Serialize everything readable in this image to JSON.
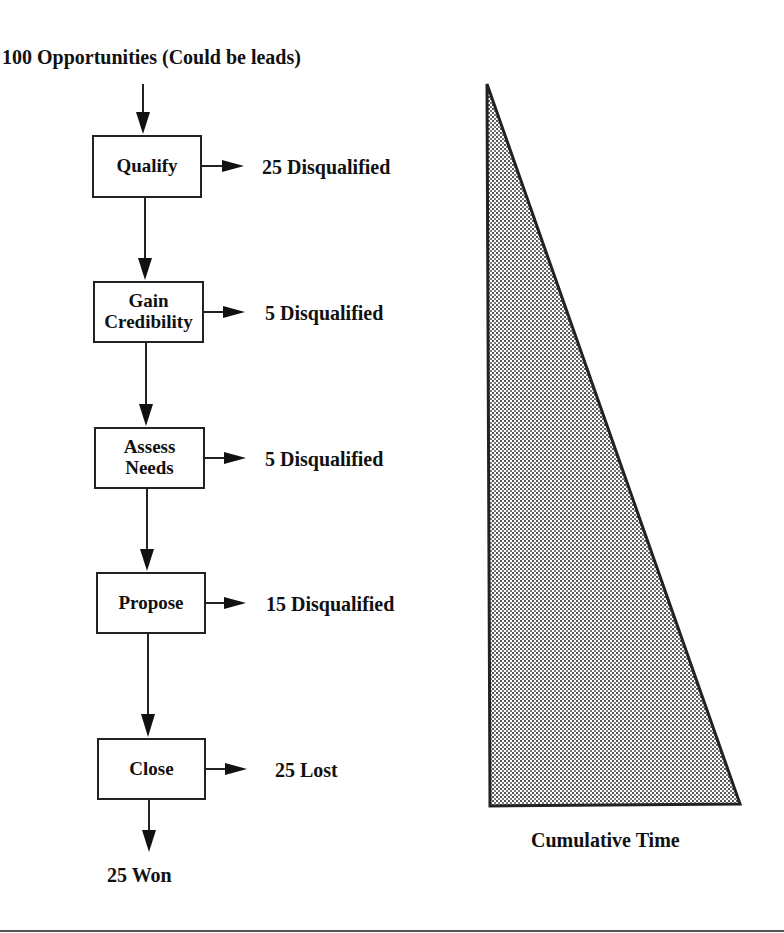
{
  "diagram": {
    "input_label": "100 Opportunities (Could be leads)",
    "stages": [
      {
        "label": "Qualify",
        "outcome": "25 Disqualified"
      },
      {
        "label": "Gain Credibility",
        "line1": "Gain",
        "line2": "Credibility",
        "outcome": "5 Disqualified"
      },
      {
        "label": "Assess Needs",
        "line1": "Assess",
        "line2": "Needs",
        "outcome": "5 Disqualified"
      },
      {
        "label": "Propose",
        "outcome": "15 Disqualified"
      },
      {
        "label": "Close",
        "outcome": "25 Lost"
      }
    ],
    "final_output": "25 Won",
    "time_triangle": {
      "label": "Cumulative Time",
      "fill": "dotted gray pattern",
      "stroke": "#222222"
    }
  },
  "colors": {
    "background": "#ffffff",
    "text": "#111111",
    "lines": "#222222",
    "pattern_dot": "#555555"
  }
}
